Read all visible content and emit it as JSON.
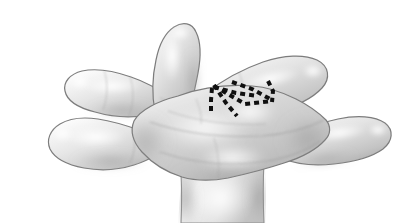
{
  "figure": {
    "view": "dorsal",
    "style": "grayscale-pencil-illustration",
    "background_color": "#ffffff",
    "width": 409,
    "height": 223
  },
  "colors": {
    "background": "#ffffff",
    "skin_light": "#fbfbfb",
    "skin_mid": "#d8d8d8",
    "skin_shadow": "#b0b0b0",
    "skin_deep_shadow": "#8f8f8f",
    "outline": "#6e6e6e",
    "outline_soft": "#9a9a9a",
    "marking": "#101010",
    "highlight": "#ffffff"
  },
  "anatomy": {
    "digits": [
      {
        "name": "digit-1-thumb",
        "label": "Thumb",
        "direction": "left-lower"
      },
      {
        "name": "digit-2-index",
        "label": "Index finger",
        "direction": "left-upper"
      },
      {
        "name": "digit-3-middle",
        "label": "Middle finger",
        "direction": "up"
      },
      {
        "name": "digit-4-ring",
        "label": "Ring finger",
        "direction": "right-upper"
      },
      {
        "name": "digit-5-little",
        "label": "Little finger",
        "direction": "right-lower"
      }
    ],
    "palm": {
      "name": "palm-dorsum",
      "label": "Dorsum of hand"
    },
    "wrist": {
      "name": "wrist",
      "label": "Wrist"
    }
  },
  "marking": {
    "name": "dashed-incision-marking",
    "label": "Dashed marking lines",
    "color": "#101010",
    "dash_pattern": "5 4",
    "stroke_width": 4,
    "location": "third web space / fourth metacarpal region",
    "strokes": [
      {
        "id": "stroke-1",
        "points": "214,85 226,103 237,116"
      },
      {
        "id": "stroke-2",
        "points": "214,86 245,104 272,101"
      },
      {
        "id": "stroke-3",
        "points": "214,87 236,93 258,96"
      },
      {
        "id": "stroke-4",
        "points": "212,88 211,100 211,113"
      },
      {
        "id": "stroke-5",
        "points": "232,82 252,89 272,100"
      },
      {
        "id": "stroke-6",
        "points": "268,81 273,91 272,102"
      }
    ]
  },
  "shading": {
    "contour_lines": [
      {
        "id": "contour-palm-1",
        "label": "metacarpal ridge"
      },
      {
        "id": "contour-palm-2",
        "label": "web crease"
      },
      {
        "id": "contour-wrist",
        "label": "wrist crease"
      }
    ],
    "highlights": [
      {
        "id": "highlight-thumb",
        "label": "thumb highlight"
      },
      {
        "id": "highlight-index",
        "label": "index highlight"
      },
      {
        "id": "highlight-middle",
        "label": "middle highlight"
      },
      {
        "id": "highlight-ring",
        "label": "ring highlight"
      },
      {
        "id": "highlight-little",
        "label": "little highlight"
      },
      {
        "id": "highlight-palm",
        "label": "palm highlight"
      }
    ]
  }
}
